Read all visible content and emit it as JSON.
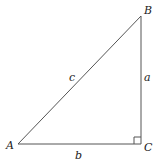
{
  "diagram": {
    "type": "right-triangle",
    "vertices": {
      "A": {
        "label": "A",
        "x": 18,
        "y": 144
      },
      "B": {
        "label": "B",
        "x": 141,
        "y": 16
      },
      "C": {
        "label": "C",
        "x": 141,
        "y": 144
      }
    },
    "sides": {
      "a": {
        "label": "a"
      },
      "b": {
        "label": "b"
      },
      "c": {
        "label": "c"
      }
    },
    "right_angle_at": "C",
    "stroke_color": "#555555"
  }
}
